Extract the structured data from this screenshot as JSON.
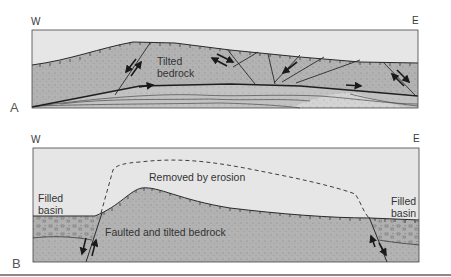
{
  "figure": {
    "panel_a": {
      "letter": "A",
      "west_label": "W",
      "east_label": "E",
      "labels": {
        "tilted_bedrock_line1": "Tilted",
        "tilted_bedrock_line2": "bedrock"
      }
    },
    "panel_b": {
      "letter": "B",
      "west_label": "W",
      "east_label": "E",
      "labels": {
        "removed_by_erosion": "Removed by erosion",
        "faulted_bedrock": "Faulted and tilted bedrock",
        "filled_basin_west_line1": "Filled",
        "filled_basin_west_line2": "basin",
        "filled_basin_east_line1": "Filled",
        "filled_basin_east_line2": "basin"
      }
    },
    "colors": {
      "sky": "#e6e6e6",
      "bedrock": "#b4b4b4",
      "sediment_layers": "#c4c4c4",
      "light_sediment": "#d6d6d6",
      "outline": "#2a2a2a"
    }
  }
}
